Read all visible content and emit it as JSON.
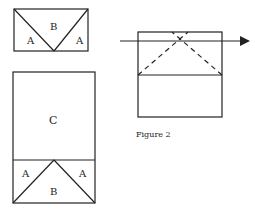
{
  "diagram": {
    "figure_label": "Figure 2",
    "top_left_panel": {
      "labels": {
        "left": "A",
        "center": "B",
        "right": "A"
      }
    },
    "bottom_left_panel": {
      "labels": {
        "top": "C",
        "left": "A",
        "center": "B",
        "right": "A"
      }
    },
    "right_panel": {
      "description": "Rectangle with horizontal divider, dashed diagonals crossing near top, horizontal arrow pointing right"
    },
    "colors": {
      "stroke": "#222222",
      "background": "#ffffff"
    }
  }
}
